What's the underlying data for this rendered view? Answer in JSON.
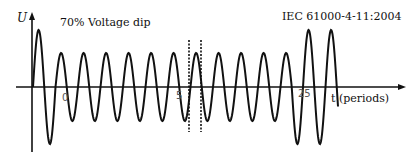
{
  "diagram": {
    "y_axis_label": "U",
    "x_axis_label": "t (periods)",
    "title_left": "70% Voltage dip",
    "title_right": "IEC 61000-4-11:2004",
    "tick_labels": [
      "0",
      "5",
      "25"
    ],
    "dip_level_percent": 70,
    "line_color": "#111111"
  }
}
